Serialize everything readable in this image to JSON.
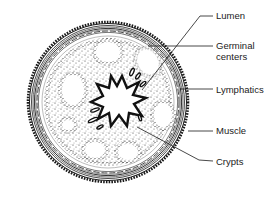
{
  "diagram": {
    "labels": [
      {
        "id": "lumen",
        "text": "Lumen",
        "x": 216,
        "y": 10
      },
      {
        "id": "germinal-centers",
        "text": "Germinal\ncenters",
        "x": 216,
        "y": 40
      },
      {
        "id": "lymphatics",
        "text": "Lymphatics",
        "x": 216,
        "y": 84
      },
      {
        "id": "muscle",
        "text": "Muscle",
        "x": 216,
        "y": 125
      },
      {
        "id": "crypts",
        "text": "Crypts",
        "x": 216,
        "y": 156
      }
    ],
    "colors": {
      "ink": "#1a1a1a",
      "background": "#ffffff"
    }
  }
}
